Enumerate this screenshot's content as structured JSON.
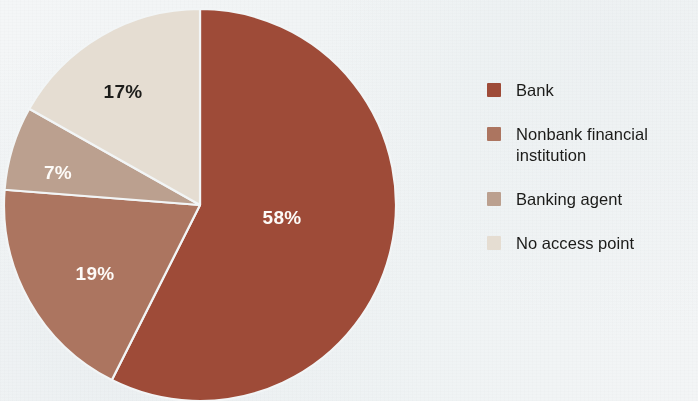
{
  "background_color": "#f2f5f6",
  "chart_data": {
    "type": "pie",
    "title": "",
    "subtitle": "",
    "xlabel": "",
    "ylabel": "",
    "legend_position": "right",
    "grid": false,
    "start_angle_deg": 0,
    "direction": "clockwise",
    "categories": [
      "Bank",
      "Nonbank financial institution",
      "Banking agent",
      "No access point"
    ],
    "values": [
      58,
      19,
      7,
      17
    ],
    "data_labels": [
      "58%",
      "19%",
      "7%",
      "17%"
    ],
    "colors": [
      "#9e4b38",
      "#ac7560",
      "#bba08f",
      "#e5ddd2"
    ],
    "label_colors": [
      "#fdfbf8",
      "#fdfbf8",
      "#fdfbf8",
      "#1d1d1b"
    ],
    "slice_separator_color": "#f2f5f6",
    "slices": [
      {
        "name": "Bank",
        "value": 58,
        "label": "58%",
        "color": "#9e4b38",
        "label_color": "#fdfbf8"
      },
      {
        "name": "Nonbank financial institution",
        "value": 19,
        "label": "19%",
        "color": "#ac7560",
        "label_color": "#fdfbf8"
      },
      {
        "name": "Banking agent",
        "value": 7,
        "label": "7%",
        "color": "#bba08f",
        "label_color": "#fdfbf8"
      },
      {
        "name": "No access point",
        "value": 17,
        "label": "17%",
        "color": "#e5ddd2",
        "label_color": "#1d1d1b"
      }
    ]
  },
  "pie": {
    "center_x": 200,
    "center_y": 205,
    "radius": 196,
    "labels": [
      {
        "text": "58%",
        "x": 282,
        "y": 224
      },
      {
        "text": "19%",
        "x": 95,
        "y": 280
      },
      {
        "text": "7%",
        "x": 58,
        "y": 179
      },
      {
        "text": "17%",
        "x": 123,
        "y": 98
      }
    ]
  },
  "legend": {
    "items": [
      {
        "label": "Bank",
        "color": "#9e4b38"
      },
      {
        "label": "Nonbank financial\ninstitution",
        "color": "#ac7560"
      },
      {
        "label": "Banking agent",
        "color": "#bba08f"
      },
      {
        "label": "No access point",
        "color": "#e5ddd2"
      }
    ]
  }
}
